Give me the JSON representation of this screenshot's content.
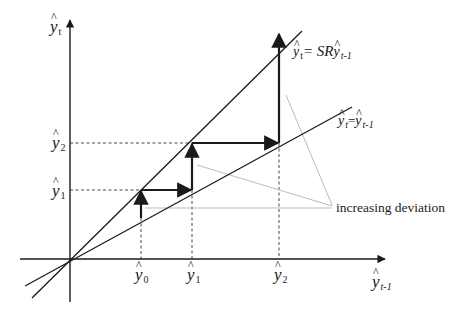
{
  "diagram": {
    "type": "cobweb-staircase",
    "axes": {
      "y_axis_label": {
        "base": "y",
        "sub": "t"
      },
      "x_axis_label": {
        "base": "y",
        "sub": "t-1"
      },
      "origin": [
        70,
        259
      ]
    },
    "lines": {
      "steep": {
        "label_lhs": {
          "base": "y",
          "sub": "t"
        },
        "label_eq": "= SR",
        "label_rhs": {
          "base": "y",
          "sub": "t-1"
        }
      },
      "diagonal": {
        "label_lhs": {
          "base": "y",
          "sub": "t"
        },
        "label_eq": "=",
        "label_rhs": {
          "base": "y",
          "sub": "t-1"
        }
      }
    },
    "x_ticks": [
      {
        "base": "y",
        "sub": "0"
      },
      {
        "base": "y",
        "sub": "1"
      },
      {
        "base": "y",
        "sub": "2"
      }
    ],
    "y_ticks": [
      {
        "base": "y",
        "sub": "2"
      },
      {
        "base": "y",
        "sub": "1"
      }
    ],
    "annotation": "increasing deviation",
    "colors": {
      "line": "#1a1a1a",
      "guide": "#bbbbbb",
      "dashed": "#333333"
    }
  }
}
